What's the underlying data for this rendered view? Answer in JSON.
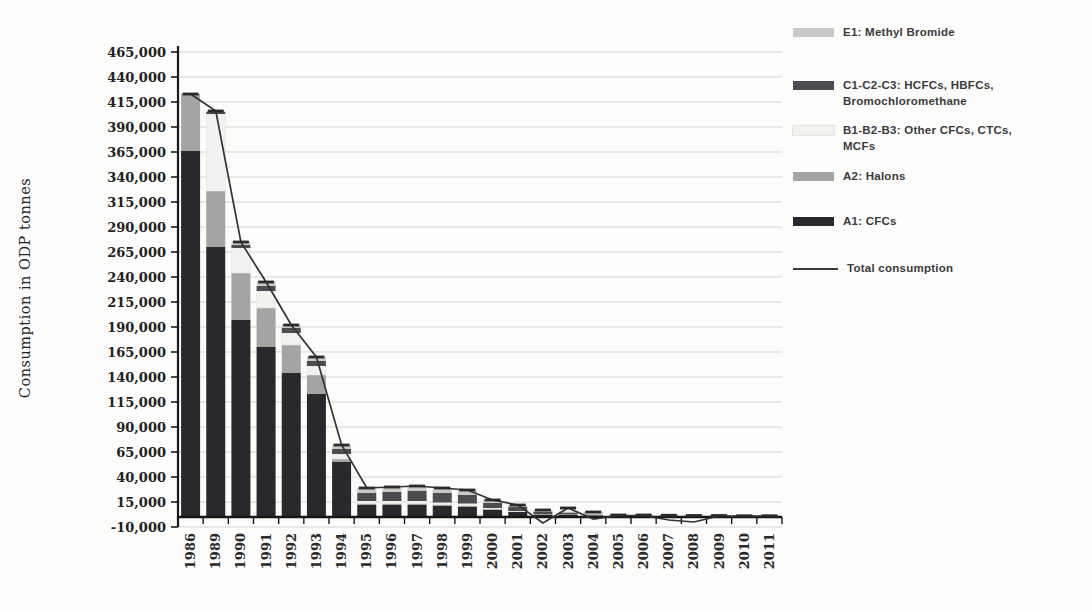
{
  "y_axis": {
    "title": "Consumption in ODP tonnes"
  },
  "legend": {
    "items": [
      {
        "label": "E1: Methyl Bromide",
        "color": "#c9c9c8",
        "type": "box"
      },
      {
        "label": "C1-C2-C3: HCFCs, HBFCs,\nBromochloromethane",
        "color": "#4c4c51",
        "type": "box"
      },
      {
        "label": "B1-B2-B3: Other CFCs, CTCs,\nMCFs",
        "color": "#f1f1ef",
        "type": "box"
      },
      {
        "label": "A2: Halons",
        "color": "#a4a4a3",
        "type": "box"
      },
      {
        "label": "A1: CFCs",
        "color": "#28282d",
        "type": "box"
      },
      {
        "label": "Total consumption",
        "color": "#3a3a3a",
        "type": "line"
      }
    ]
  },
  "chart_data": {
    "type": "bar",
    "subtype": "stacked-bars-with-total-line",
    "title": "",
    "xlabel": "",
    "ylabel": "Consumption in ODP tonnes",
    "ylim": [
      -10000,
      465000
    ],
    "ytick_step": 25000,
    "grid": true,
    "legend_position": "top-right",
    "categories": [
      "1986",
      "1989",
      "1990",
      "1991",
      "1992",
      "1993",
      "1994",
      "1995",
      "1996",
      "1997",
      "1998",
      "1999",
      "2000",
      "2001",
      "2002",
      "2003",
      "2004",
      "2005",
      "2006",
      "2007",
      "2008",
      "2009",
      "2010",
      "2011"
    ],
    "series": [
      {
        "name": "A1: CFCs",
        "color": "#28282d",
        "values": [
          366000,
          270000,
          197000,
          170000,
          144000,
          123000,
          55000,
          12000,
          12000,
          12000,
          11000,
          10000,
          7000,
          5000,
          2500,
          2000,
          1000,
          1000,
          1000,
          1000,
          750,
          750,
          750,
          750
        ]
      },
      {
        "name": "A2: Halons",
        "color": "#a4a4a3",
        "values": [
          57000,
          56000,
          47000,
          39000,
          28000,
          19000,
          3000,
          1500,
          1500,
          1500,
          1500,
          1500,
          1000,
          500,
          500,
          500,
          500,
          0,
          0,
          0,
          0,
          0,
          0,
          0
        ]
      },
      {
        "name": "B1-B2-B3: Other CFCs, CTCs, MCFs",
        "color": "#f1f1ef",
        "values": [
          0,
          77000,
          25000,
          17000,
          12000,
          9000,
          5000,
          2500,
          2500,
          2500,
          2000,
          2000,
          1000,
          500,
          0,
          0,
          0,
          0,
          0,
          0,
          0,
          0,
          0,
          0
        ]
      },
      {
        "name": "C1-C2-C3: HCFCs, HBFCs, Bromochloromethane",
        "color": "#4c4c51",
        "values": [
          0,
          2000,
          3000,
          5000,
          5000,
          5000,
          5000,
          8000,
          9000,
          10000,
          9500,
          8500,
          5000,
          4000,
          2500,
          2000,
          1000,
          500,
          500,
          500,
          500,
          500,
          250,
          250
        ]
      },
      {
        "name": "E1: Methyl Bromide",
        "color": "#c9c9c8",
        "values": [
          0,
          1000,
          3000,
          4000,
          3000,
          4000,
          4000,
          5000,
          5000,
          5000,
          5000,
          5000,
          3000,
          2000,
          1500,
          1000,
          2500,
          500,
          500,
          250,
          250,
          250,
          250,
          250
        ]
      }
    ],
    "line_series": {
      "name": "Total consumption",
      "color": "#333333",
      "values": [
        423000,
        406000,
        275000,
        235000,
        192000,
        160000,
        72000,
        29000,
        30000,
        31000,
        29000,
        27000,
        17000,
        12000,
        -6000,
        9000,
        -2000,
        1500,
        1500,
        -3000,
        -5000,
        1000,
        1000,
        1000
      ]
    }
  }
}
